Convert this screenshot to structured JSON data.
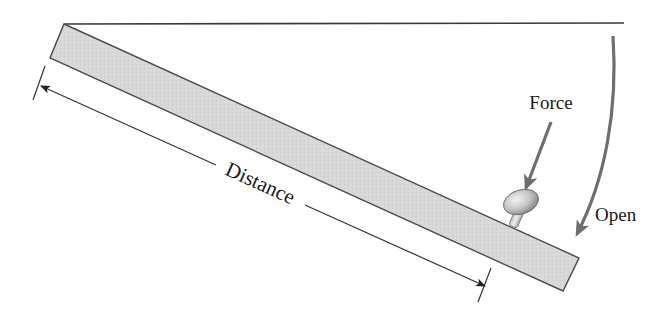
{
  "diagram": {
    "title": "",
    "labels": {
      "force": "Force",
      "open": "Open",
      "distance": "Distance"
    },
    "colors": {
      "door_fill": "#d6d6d6",
      "door_stroke": "#4a4a4a",
      "line": "#333333",
      "arrow_accent": "#6e6e6e",
      "knob_fill": "#cfcfcf"
    }
  }
}
